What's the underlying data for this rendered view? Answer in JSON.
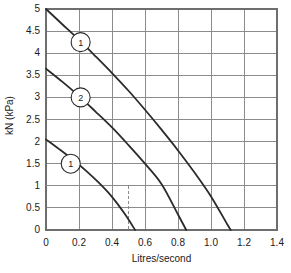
{
  "chart_data": {
    "type": "line",
    "title": "",
    "xlabel": "Litres/second",
    "ylabel": "kN (kPa)",
    "xlim": [
      0,
      1.4
    ],
    "ylim": [
      0,
      5
    ],
    "grid": true,
    "legend": "none",
    "x_ticks": [
      "0",
      "0.2",
      "0.4",
      "0.6",
      "0.8",
      "1.0",
      "1.2",
      "1.4"
    ],
    "x_tick_values": [
      0,
      0.2,
      0.4,
      0.6,
      0.8,
      1.0,
      1.2,
      1.4
    ],
    "y_ticks": [
      "0",
      "0.5",
      "1",
      "1.5",
      "2",
      "2.5",
      "3",
      "3.5",
      "4",
      "4.5",
      "5"
    ],
    "y_tick_values": [
      0,
      0.5,
      1,
      1.5,
      2,
      2.5,
      3,
      3.5,
      4,
      4.5,
      5
    ],
    "series": [
      {
        "name": "curve-top",
        "marker_label": "1",
        "marker_point": [
          0.21,
          4.25
        ],
        "x": [
          0.0,
          0.1,
          0.2,
          0.3,
          0.4,
          0.5,
          0.6,
          0.7,
          0.8,
          0.9,
          1.0,
          1.1,
          1.12
        ],
        "values": [
          5.0,
          4.65,
          4.3,
          3.93,
          3.55,
          3.15,
          2.72,
          2.27,
          1.8,
          1.3,
          0.76,
          0.12,
          0.0
        ]
      },
      {
        "name": "curve-middle",
        "marker_label": "2",
        "marker_point": [
          0.21,
          3.0
        ],
        "x": [
          0.0,
          0.1,
          0.2,
          0.3,
          0.4,
          0.5,
          0.6,
          0.7,
          0.8,
          0.85
        ],
        "values": [
          3.65,
          3.35,
          3.03,
          2.68,
          2.32,
          1.92,
          1.5,
          1.04,
          0.35,
          0.0
        ]
      },
      {
        "name": "curve-bottom",
        "marker_label": "1",
        "marker_point": [
          0.15,
          1.5
        ],
        "x": [
          0.0,
          0.08,
          0.16,
          0.24,
          0.32,
          0.4,
          0.48,
          0.54
        ],
        "values": [
          2.05,
          1.83,
          1.6,
          1.35,
          1.07,
          0.75,
          0.35,
          0.0
        ]
      }
    ],
    "annotations": [
      {
        "name": "construction-line-horizontal",
        "style": "dashed",
        "from": [
          0.0,
          1.0
        ],
        "to": [
          0.5,
          1.0
        ]
      },
      {
        "name": "construction-line-vertical",
        "style": "dashed",
        "from": [
          0.5,
          1.0
        ],
        "to": [
          0.5,
          0.0
        ]
      }
    ],
    "colors": {
      "curve": "#2b2b2b",
      "grid": "#8c8c8c",
      "axis": "#6e6e6e",
      "dashed": "#8c8c8c",
      "text": "#1a1a1a",
      "background": "#ffffff"
    }
  }
}
